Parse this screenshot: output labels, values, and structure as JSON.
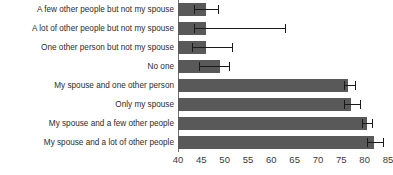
{
  "chart_data": {
    "type": "bar",
    "orientation": "horizontal",
    "title": "",
    "subtitle": "",
    "xlabel": "",
    "ylabel": "",
    "xlim": [
      40,
      85
    ],
    "xticks": [
      40,
      45,
      50,
      55,
      60,
      65,
      70,
      75,
      80,
      85
    ],
    "grid": false,
    "legend": "none",
    "bar_color": "#595959",
    "error_color": "#1a1a1a",
    "background": "#ffffff",
    "categories": [
      "A few other people but not my spouse",
      "A lot of other people but not my spouse",
      "One other person but not my spouse",
      "No one",
      "My spouse and one other person",
      "Only my spouse",
      "My spouse and a few other people",
      "My spouse and a lot of other people"
    ],
    "values": [
      46.0,
      46.0,
      46.0,
      49.0,
      76.5,
      77.0,
      80.5,
      82.0
    ],
    "error_low": [
      43.5,
      43.5,
      43.0,
      44.5,
      75.5,
      75.5,
      79.5,
      80.5
    ],
    "error_high": [
      48.5,
      63.0,
      51.5,
      51.0,
      78.0,
      79.0,
      81.5,
      84.0
    ]
  }
}
